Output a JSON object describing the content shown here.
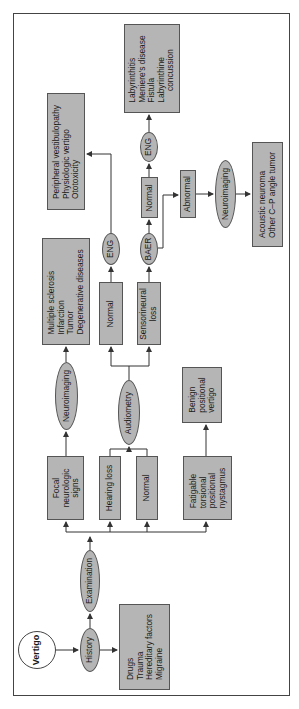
{
  "diagram": {
    "title": "Vertigo",
    "colors": {
      "box_fill": "#b5b5b5",
      "border": "#555555",
      "line": "#333333",
      "start_fill": "#ffffff"
    },
    "nodes": {
      "vertigo": "Vertigo",
      "history": "History",
      "history_factors": "Drugs\nTrauma\nHereditary factors\nMigraine",
      "examination": "Examination",
      "focal": "Focal\nneurologic\nsigns",
      "hearing_loss": "Hearing loss",
      "normal_exam": "Normal",
      "fatigable": "Fatigable\ntorsional\npositional\nnystagmus",
      "neuroimaging_focal": "Neuroimaging",
      "central_dx": "Multiple sclerosis\nInfarction\nTumor\nDegenerative diseases",
      "audiometry": "Audiometry",
      "benign": "Benign\npositional\nvertigo",
      "normal_audio": "Normal",
      "sensorineural": "Sensorineural\nloss",
      "eng_1": "ENG",
      "baer": "BAER",
      "peripheral_dx": "Peripheral vestibulopathy\nPhysiologic vertigo\nOtotoxicity",
      "normal_baer": "Normal",
      "abnormal_baer": "Abnormal",
      "eng_2": "ENG",
      "neuroimaging_baer": "Neuroimaging",
      "labyrinth_dx": "Labyrinthitis\nMeniere's disease\nFistula\nLabyrinthine\n     concussion",
      "acoustic_dx": "Acoustic neuroma\nOther C–P angle tumor"
    },
    "edges": [
      [
        "vertigo",
        "history"
      ],
      [
        "history",
        "history_factors"
      ],
      [
        "history",
        "examination"
      ],
      [
        "examination",
        "focal"
      ],
      [
        "examination",
        "hearing_loss"
      ],
      [
        "examination",
        "normal_exam"
      ],
      [
        "examination",
        "fatigable"
      ],
      [
        "focal",
        "neuroimaging_focal"
      ],
      [
        "neuroimaging_focal",
        "central_dx"
      ],
      [
        "hearing_loss",
        "audiometry"
      ],
      [
        "normal_exam",
        "audiometry"
      ],
      [
        "audiometry",
        "normal_audio"
      ],
      [
        "audiometry",
        "sensorineural"
      ],
      [
        "fatigable",
        "benign"
      ],
      [
        "normal_audio",
        "eng_1"
      ],
      [
        "eng_1",
        "peripheral_dx"
      ],
      [
        "sensorineural",
        "baer"
      ],
      [
        "baer",
        "normal_baer"
      ],
      [
        "baer",
        "abnormal_baer"
      ],
      [
        "normal_baer",
        "eng_2"
      ],
      [
        "eng_2",
        "labyrinth_dx"
      ],
      [
        "abnormal_baer",
        "neuroimaging_baer"
      ],
      [
        "neuroimaging_baer",
        "acoustic_dx"
      ]
    ]
  }
}
